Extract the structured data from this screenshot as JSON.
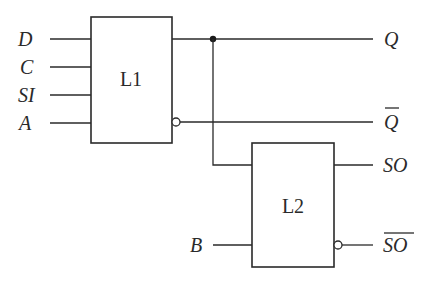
{
  "diagram": {
    "type": "logic-circuit",
    "blocks": [
      {
        "id": "L1",
        "label": "L1"
      },
      {
        "id": "L2",
        "label": "L2"
      }
    ],
    "inputs": {
      "D": "D",
      "C": "C",
      "SI": "SI",
      "A": "A",
      "B": "B"
    },
    "outputs": {
      "Q": "Q",
      "Q_bar": "Q",
      "SO": "SO",
      "SO_bar": "SO"
    },
    "connections": [
      {
        "from": "D",
        "to": "L1"
      },
      {
        "from": "C",
        "to": "L1"
      },
      {
        "from": "SI",
        "to": "L1"
      },
      {
        "from": "A",
        "to": "L1"
      },
      {
        "from": "L1.out",
        "to": "Q"
      },
      {
        "from": "L1.out_inverted",
        "to": "Q_bar"
      },
      {
        "from": "L1.out",
        "to": "L2"
      },
      {
        "from": "B",
        "to": "L2"
      },
      {
        "from": "L2.out",
        "to": "SO"
      },
      {
        "from": "L2.out_inverted",
        "to": "SO_bar"
      }
    ]
  }
}
